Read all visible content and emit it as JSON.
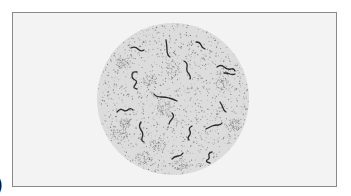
{
  "figure": {
    "panel_label": ")",
    "colors": {
      "background": "#ffffff",
      "frame_fill": "#f3f3f3",
      "frame_border": "#8a8a8a",
      "field_fill": "#dcdcdc",
      "stipple": "#6e6e6e",
      "organism": "#2a2a2a"
    },
    "field": {
      "cx": 173,
      "cy": 99,
      "r": 76
    },
    "organisms": [
      {
        "id": 1,
        "path": "M131 48 q4 -2 7 1 q3 3 6 1"
      },
      {
        "id": 2,
        "path": "M166 40 q1 6 1 10 q0 5 3 7"
      },
      {
        "id": 3,
        "path": "M196 42 q4 0 5 3 q1 3 4 4"
      },
      {
        "id": 4,
        "path": "M184 61 q4 2 3 6 q-1 4 2 7 q2 3 1 5"
      },
      {
        "id": 5,
        "path": "M217 67 q4 -3 7 0 q3 3 7 2 q3 -1 4 2"
      },
      {
        "id": 6,
        "path": "M224 73 q4 0 6 1 q3 1 5 0"
      },
      {
        "id": 7,
        "path": "M137 72 q-5 -1 -5 3 q0 4 3 5 q3 1 0 5 q-3 3 2 4"
      },
      {
        "id": 8,
        "path": "M154 94 q2 3 7 3 q5 0 8 1 q4 1 8 3"
      },
      {
        "id": 9,
        "path": "M220 102 q2 3 3 6 q1 3 3 4"
      },
      {
        "id": 10,
        "path": "M117 112 q3 -4 6 -2 q3 2 6 -1 q2 -1 4 1"
      },
      {
        "id": 11,
        "path": "M172 113 q3 3 0 6 q-3 3 -3 5"
      },
      {
        "id": 12,
        "path": "M141 122 q-3 4 0 8 q3 4 1 8 q-1 3 2 4"
      },
      {
        "id": 13,
        "path": "M192 126 q-4 2 -2 5 q1 3 -1 5 q-2 2 0 4"
      },
      {
        "id": 14,
        "path": "M206 129 q4 -2 6 -3 q3 -1 6 -1 q3 0 4 -2"
      },
      {
        "id": 15,
        "path": "M172 159 q3 -3 6 -3 q3 0 5 -3"
      },
      {
        "id": 16,
        "path": "M212 152 q-4 1 -3 4 q1 3 -2 4 q-2 2 3 3"
      }
    ],
    "clusters": [
      {
        "cx": 150,
        "cy": 80,
        "rx": 8,
        "ry": 6
      },
      {
        "cx": 173,
        "cy": 68,
        "rx": 7,
        "ry": 10
      },
      {
        "cx": 123,
        "cy": 63,
        "rx": 6,
        "ry": 6
      },
      {
        "cx": 222,
        "cy": 80,
        "rx": 7,
        "ry": 12
      },
      {
        "cx": 165,
        "cy": 108,
        "rx": 8,
        "ry": 8
      },
      {
        "cx": 125,
        "cy": 123,
        "rx": 6,
        "ry": 5
      },
      {
        "cx": 120,
        "cy": 135,
        "rx": 8,
        "ry": 6
      },
      {
        "cx": 158,
        "cy": 145,
        "rx": 8,
        "ry": 6
      },
      {
        "cx": 143,
        "cy": 158,
        "rx": 10,
        "ry": 7
      },
      {
        "cx": 180,
        "cy": 165,
        "rx": 8,
        "ry": 5
      },
      {
        "cx": 235,
        "cy": 125,
        "rx": 6,
        "ry": 6
      }
    ]
  }
}
